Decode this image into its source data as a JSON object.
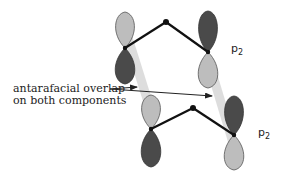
{
  "diagram": {
    "annotation": {
      "line1": "antarafacial overlap",
      "line2": "on both components"
    },
    "orbital_labels": [
      {
        "base": "p",
        "subscript": "2"
      },
      {
        "base": "p",
        "subscript": "2"
      }
    ],
    "colors": {
      "light_lobe": "#bdbdbd",
      "dark_lobe": "#4a4a4a",
      "overlap_band": "#d9d9d9",
      "bond": "#111111",
      "arrow": "#222222"
    }
  }
}
